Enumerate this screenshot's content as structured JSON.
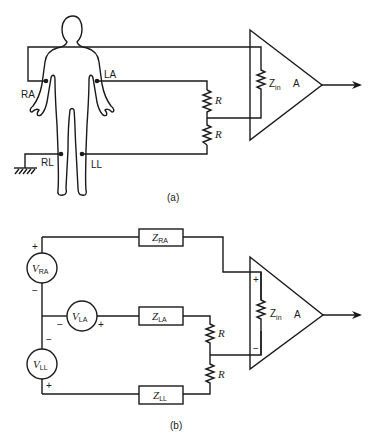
{
  "figure": {
    "panel_a": {
      "caption": "(a)",
      "electrodes": {
        "ra": "RA",
        "la": "LA",
        "rl": "RL",
        "ll": "LL"
      },
      "resistor_top": "R",
      "resistor_bottom": "R",
      "zin_main": "Z",
      "zin_sub": "in",
      "amp_label": "A"
    },
    "panel_b": {
      "caption": "(b)",
      "sources": [
        {
          "main": "V",
          "sub": "RA"
        },
        {
          "main": "V",
          "sub": "LA"
        },
        {
          "main": "V",
          "sub": "LL"
        }
      ],
      "impedances": [
        {
          "main": "Z",
          "sub": "RA"
        },
        {
          "main": "Z",
          "sub": "LA"
        },
        {
          "main": "Z",
          "sub": "LL"
        }
      ],
      "polarity": {
        "plus": "+",
        "minus": "−"
      },
      "resistor_top": "R",
      "resistor_bottom": "R",
      "zin_main": "Z",
      "zin_sub": "in",
      "amp_label": "A",
      "amp_plus": "+",
      "amp_minus": "−"
    }
  }
}
